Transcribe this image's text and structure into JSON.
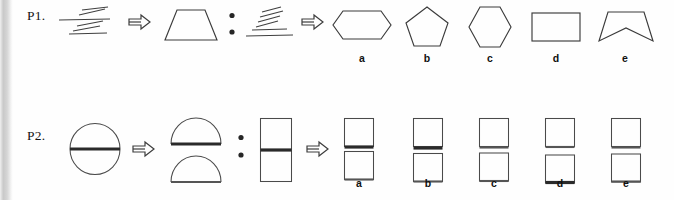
{
  "document": {
    "kind": "visual-analogy-worksheet",
    "background_color": "#fefefe",
    "ink_color": "#3b3b3b",
    "accent_bar_color": "#2a2a2a"
  },
  "problems": [
    {
      "id": "P1",
      "label": "P1.",
      "relation_symbol": "⇒",
      "analogy_symbol": ":",
      "stem": [
        {
          "role": "A",
          "name": "hatched-lines-group",
          "description": "three short slanted strokes above a long horizontal line and a second pair of slanted strokes below"
        },
        {
          "role": "B",
          "name": "trapezoid",
          "description": "isosceles trapezoid with narrow top and wide base"
        },
        {
          "role": "C",
          "name": "hatched-lines-group-stacked",
          "description": "four short slanted strokes stacked diagonally above two long horizontal lines"
        }
      ],
      "options": [
        {
          "key": "a",
          "label": "a",
          "name": "elongated-hexagon",
          "description": "wide elongated hexagon"
        },
        {
          "key": "b",
          "label": "b",
          "name": "pentagon",
          "description": "regular pentagon, apex up"
        },
        {
          "key": "c",
          "label": "c",
          "name": "hexagon",
          "description": "regular hexagon, vertex left and right"
        },
        {
          "key": "d",
          "label": "d",
          "name": "rectangle",
          "description": "plain horizontal rectangle"
        },
        {
          "key": "e",
          "label": "e",
          "name": "concave-quadrilateral",
          "description": "trapezoid-like shape with a notch dipping into the base"
        }
      ]
    },
    {
      "id": "P2",
      "label": "P2.",
      "relation_symbol": "⇒",
      "analogy_symbol": ":",
      "stem": [
        {
          "role": "A",
          "name": "circle-with-horizontal-bar",
          "description": "circle bisected by a thick horizontal bar"
        },
        {
          "role": "B",
          "name": "split-semicircles",
          "description": "two semicircles separated vertically, each with a flat bar edge"
        },
        {
          "role": "C",
          "name": "rectangle-with-horizontal-bar",
          "description": "tall rectangle bisected by a thick horizontal bar"
        }
      ],
      "options": [
        {
          "key": "a",
          "label": "a",
          "name": "stacked-squares-thick-gap",
          "description": "two squares stacked with a thick bar between them"
        },
        {
          "key": "b",
          "label": "b",
          "name": "stacked-squares-thick-gap-wide",
          "description": "two squares stacked with a thick bar and visible gap"
        },
        {
          "key": "c",
          "label": "c",
          "name": "stacked-squares-thin-gap",
          "description": "two squares stacked with thin separating edges"
        },
        {
          "key": "d",
          "label": "d",
          "name": "stacked-squares-clear-gap",
          "description": "two squares stacked with a clear open gap between them"
        },
        {
          "key": "e",
          "label": "e",
          "name": "stacked-squares-medium-gap",
          "description": "two squares stacked with a medium separating bar"
        }
      ]
    }
  ]
}
